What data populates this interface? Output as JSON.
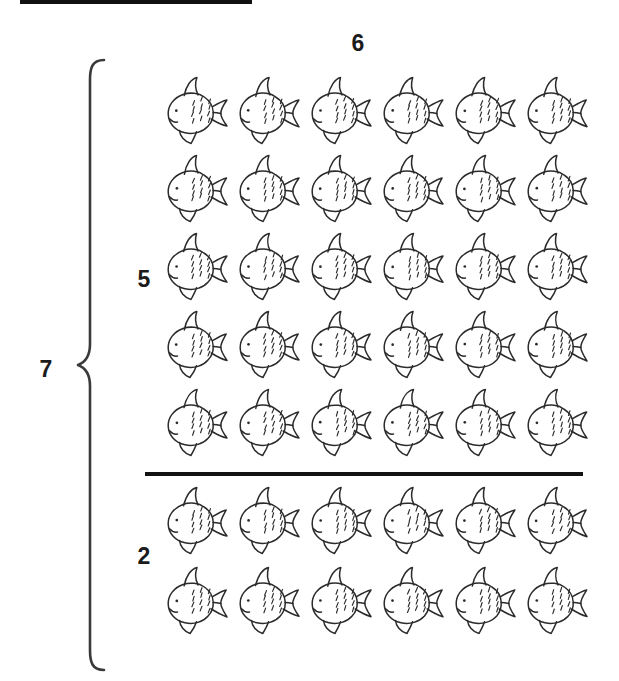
{
  "image": {
    "kind": "math-array-worksheet-illustration",
    "background_color": "#ffffff",
    "ink_color": "#2b2b2b",
    "label_color": "#1b1b1b",
    "width": 619,
    "height": 681
  },
  "top_bar": {
    "name": "scanned-page-edge-bar",
    "color": "#111111"
  },
  "labels": {
    "columns": "6",
    "total_rows": "7",
    "group_top_rows": "5",
    "group_bottom_rows": "2"
  },
  "brace": {
    "name": "left-curly-brace",
    "color": "#3a3a3a",
    "spans_label": "7"
  },
  "divider": {
    "name": "group-divider-line",
    "color": "#121212"
  },
  "icon": {
    "name": "fish-icon",
    "stroke": "#2b2b2b",
    "fill": "none"
  },
  "array": {
    "columns": 6,
    "total_rows": 7,
    "groups": [
      {
        "id": "top",
        "rows": 5,
        "label": "5",
        "fish_per_row": 6,
        "total": 30
      },
      {
        "id": "bottom",
        "rows": 2,
        "label": "2",
        "fish_per_row": 6,
        "total": 12
      }
    ],
    "total_fish": 42
  },
  "chart_data": {
    "type": "table",
    "title": "",
    "categories": [
      "top group",
      "bottom group"
    ],
    "series": [
      {
        "name": "rows",
        "values": [
          5,
          2
        ]
      },
      {
        "name": "columns",
        "values": [
          6,
          6
        ]
      },
      {
        "name": "fish count",
        "values": [
          30,
          12
        ]
      }
    ],
    "annotations": [
      "6",
      "7",
      "5",
      "2"
    ],
    "xlabel": "",
    "ylabel": ""
  }
}
